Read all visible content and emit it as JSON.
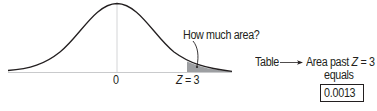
{
  "diagram": {
    "type": "normal-distribution-tail-area",
    "curve": {
      "center_label": "0",
      "z_label_var": "Z",
      "z_label_eq": " = 3",
      "shaded_region": "right tail beyond Z = 3",
      "shade_color": "#9d9fa2",
      "line_color": "#231f20",
      "axis_color": "#c9cacc"
    },
    "callout": {
      "question": "How much area?"
    },
    "lookup": {
      "source": "Table",
      "result_line1_prefix": "Area past ",
      "result_line1_var": "Z",
      "result_line1_suffix": " = 3",
      "result_line2": "equals",
      "value": "0.0013"
    }
  }
}
